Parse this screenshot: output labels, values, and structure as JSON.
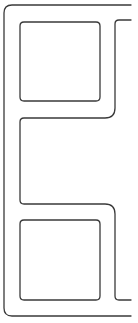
{
  "diagram": {
    "width": 138,
    "height": 323,
    "stroke_color": "#3a3a3a",
    "stroke_width": 1.3,
    "shapes": [
      {
        "name": "outer-frame",
        "d": "M131 5 L12 5 Q4 5 4 13 L4 308 Q4 316 12 316 L131 316"
      },
      {
        "name": "top-box",
        "d": "M24 22 L96 22 Q100 22 100 26 L100 97 Q100 101 96 101 L24 101 Q20 101 20 97 L20 26 Q20 22 24 22 Z"
      },
      {
        "name": "right-connector-top",
        "d": "M131 20 L119 20 Q115 20 115 24 L115 108 Q115 118 105 118 L24 118 Q20 118 20 122 L20 200 Q20 204 24 204 L105 204 Q115 204 115 214 L115 296 Q115 300 119 300 L131 300"
      },
      {
        "name": "bottom-box",
        "d": "M24 220 L96 220 Q100 220 100 224 L100 296 Q100 300 96 300 L24 300 Q20 300 20 296 L20 224 Q20 220 24 220 Z"
      }
    ]
  }
}
